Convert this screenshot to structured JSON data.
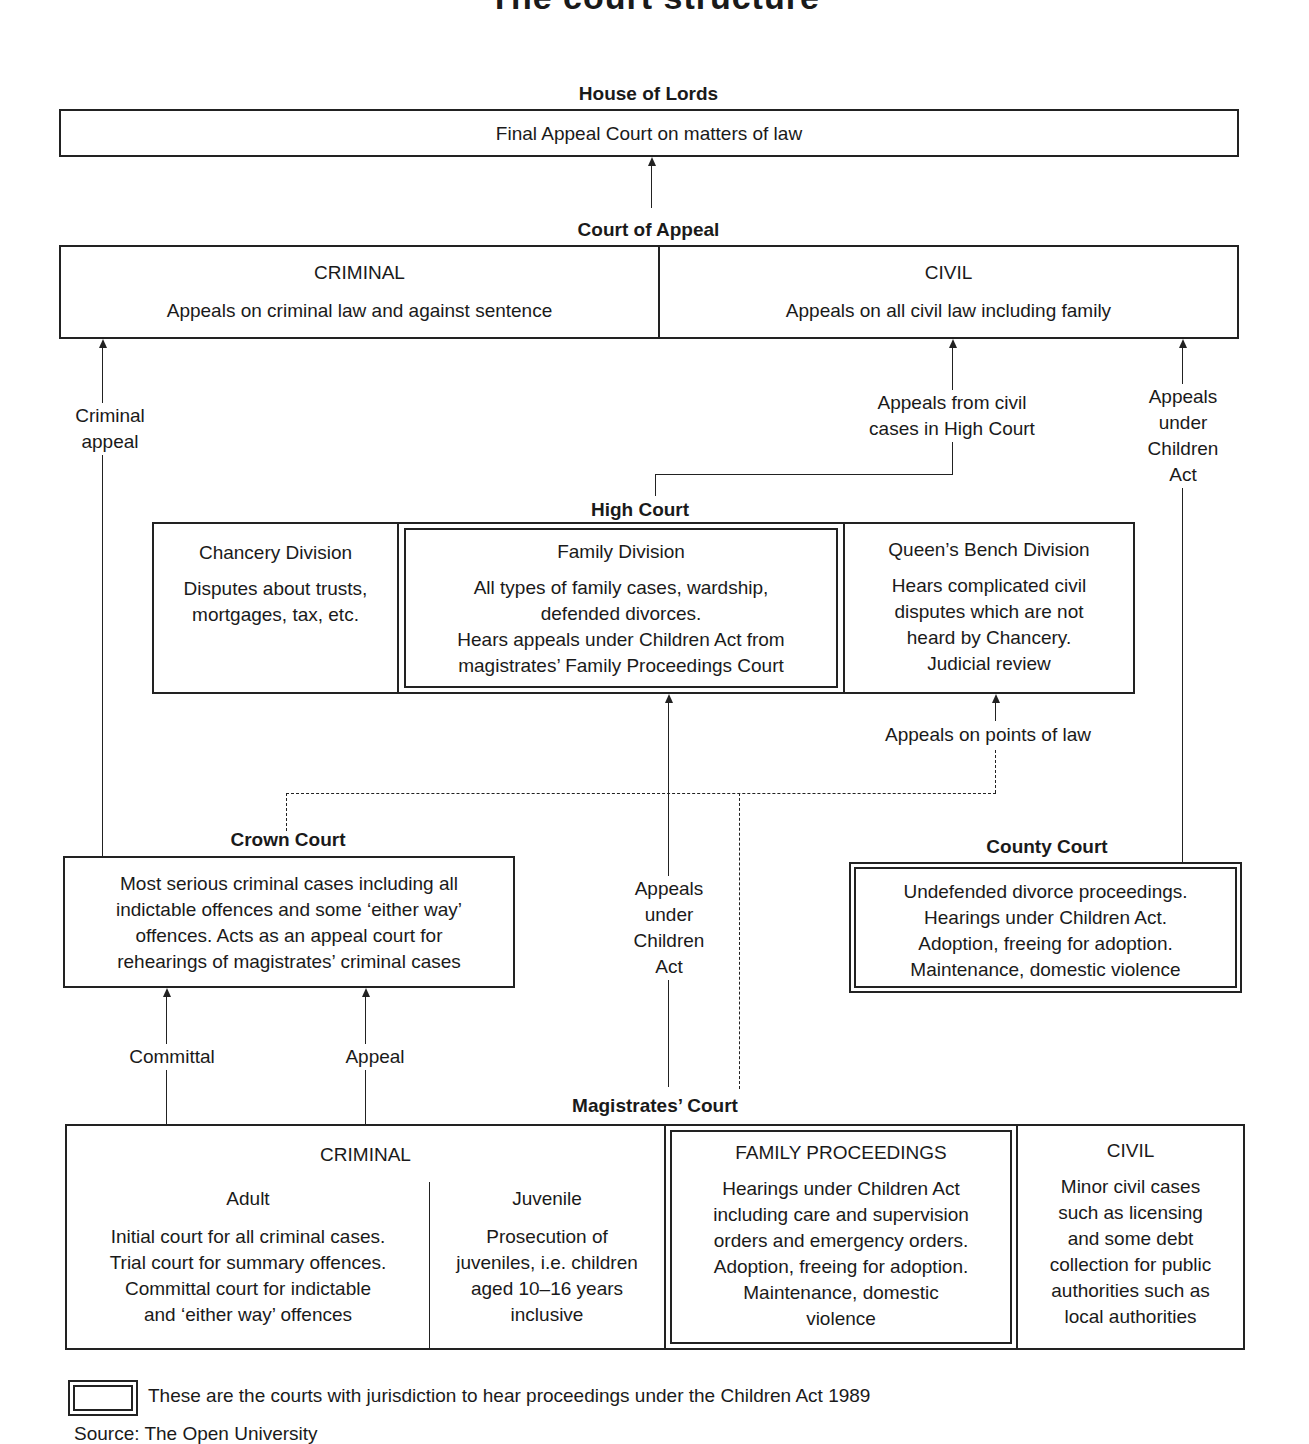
{
  "title": "The court structure",
  "house_of_lords": {
    "heading": "House of Lords",
    "text": "Final Appeal Court on matters of law"
  },
  "court_of_appeal": {
    "heading": "Court of Appeal",
    "criminal": {
      "title": "CRIMINAL",
      "text": "Appeals on criminal law and against sentence"
    },
    "civil": {
      "title": "CIVIL",
      "text": "Appeals on all civil law including family"
    }
  },
  "connectors": {
    "criminal_appeal": [
      "Criminal",
      "appeal"
    ],
    "appeals_from_civil": [
      "Appeals from civil",
      "cases in High Court"
    ],
    "appeals_children_act_right": [
      "Appeals",
      "under",
      "Children",
      "Act"
    ],
    "appeals_points_of_law": "Appeals on points of law",
    "appeals_children_act_mid": [
      "Appeals",
      "under",
      "Children",
      "Act"
    ],
    "committal": "Committal",
    "appeal": "Appeal"
  },
  "high_court": {
    "heading": "High Court",
    "chancery": {
      "title": "Chancery Division",
      "lines": [
        "Disputes about trusts,",
        "mortgages, tax, etc."
      ]
    },
    "family": {
      "title": "Family Division",
      "lines": [
        "All types of family cases, wardship,",
        "defended divorces.",
        "Hears appeals under Children Act from",
        "magistrates’ Family Proceedings Court"
      ]
    },
    "queens_bench": {
      "title": "Queen’s Bench Division",
      "lines": [
        "Hears complicated civil",
        "disputes which are not",
        "heard by Chancery.",
        "Judicial review"
      ]
    }
  },
  "crown_court": {
    "heading": "Crown Court",
    "lines": [
      "Most serious criminal cases including all",
      "indictable offences and some ‘either way’",
      "offences. Acts as an appeal court for",
      "rehearings of magistrates’ criminal cases"
    ]
  },
  "county_court": {
    "heading": "County Court",
    "lines": [
      "Undefended divorce proceedings.",
      "Hearings under Children Act.",
      "Adoption, freeing for adoption.",
      "Maintenance, domestic violence"
    ]
  },
  "magistrates_court": {
    "heading": "Magistrates’ Court",
    "criminal": {
      "title": "CRIMINAL",
      "adult": {
        "title": "Adult",
        "lines": [
          "Initial court for all criminal cases.",
          "Trial court for summary offences.",
          "Committal court for indictable",
          "and ‘either way’ offences"
        ]
      },
      "juvenile": {
        "title": "Juvenile",
        "lines": [
          "Prosecution of",
          "juveniles, i.e. children",
          "aged 10–16 years",
          "inclusive"
        ]
      }
    },
    "family": {
      "title": "FAMILY PROCEEDINGS",
      "lines": [
        "Hearings under Children Act",
        "including care and supervision",
        "orders and emergency orders.",
        "Adoption, freeing for adoption.",
        "Maintenance, domestic",
        "violence"
      ]
    },
    "civil": {
      "title": "CIVIL",
      "lines": [
        "Minor civil cases",
        "such as licensing",
        "and some debt",
        "collection for public",
        "authorities such as",
        "local authorities"
      ]
    }
  },
  "legend": {
    "icon": "double-border-box-icon",
    "text": "These are the courts with jurisdiction to hear proceedings under the Children Act 1989"
  },
  "source": "Source: The Open University"
}
